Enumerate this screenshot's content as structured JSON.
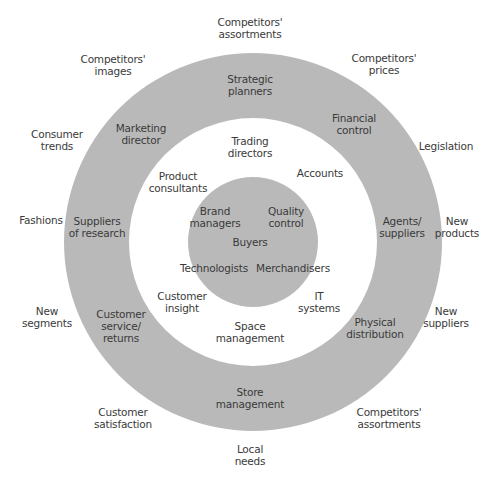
{
  "diagram": {
    "type": "concentric-circles",
    "colors": {
      "ring": "#b9b9b9",
      "background": "#ffffff",
      "text": "#3a3a3a"
    },
    "geometry": {
      "cx": 253,
      "cy": 242,
      "outer_r": 189,
      "hole_r": 124,
      "core_r": 65
    },
    "core_labels": [
      {
        "id": "brand-managers",
        "text": "Brand\nmanagers",
        "x": 215,
        "y": 217
      },
      {
        "id": "quality-control",
        "text": "Quality\ncontrol",
        "x": 286,
        "y": 217
      },
      {
        "id": "buyers",
        "text": "Buyers",
        "x": 250,
        "y": 242
      },
      {
        "id": "technologists",
        "text": "Technologists",
        "x": 214,
        "y": 268
      },
      {
        "id": "merchandisers",
        "text": "Merchandisers",
        "x": 293,
        "y": 268
      }
    ],
    "middle_labels": [
      {
        "id": "trading-directors",
        "text": "Trading\ndirectors",
        "x": 250,
        "y": 147
      },
      {
        "id": "product-consultants",
        "text": "Product\nconsultants",
        "x": 178,
        "y": 182
      },
      {
        "id": "accounts",
        "text": "Accounts",
        "x": 320,
        "y": 173
      },
      {
        "id": "customer-insight",
        "text": "Customer\ninsight",
        "x": 182,
        "y": 302
      },
      {
        "id": "it-systems",
        "text": "IT\nsystems",
        "x": 319,
        "y": 302
      },
      {
        "id": "space-management",
        "text": "Space\nmanagement",
        "x": 250,
        "y": 332
      }
    ],
    "ring_labels": [
      {
        "id": "strategic-planners",
        "text": "Strategic\nplanners",
        "x": 250,
        "y": 85
      },
      {
        "id": "marketing-director",
        "text": "Marketing\ndirector",
        "x": 141,
        "y": 134
      },
      {
        "id": "financial-control",
        "text": "Financial\ncontrol",
        "x": 354,
        "y": 124
      },
      {
        "id": "suppliers-of-research",
        "text": "Suppliers\nof research",
        "x": 97,
        "y": 227
      },
      {
        "id": "agents-suppliers",
        "text": "Agents/\nsuppliers",
        "x": 402,
        "y": 227
      },
      {
        "id": "customer-service-returns",
        "text": "Customer\nservice/\nreturns",
        "x": 121,
        "y": 326
      },
      {
        "id": "physical-distribution",
        "text": "Physical\ndistribution",
        "x": 375,
        "y": 328
      },
      {
        "id": "store-management",
        "text": "Store\nmanagement",
        "x": 250,
        "y": 398
      }
    ],
    "outer_labels": [
      {
        "id": "competitors-assortments-top",
        "text": "Competitors'\nassortments",
        "x": 250,
        "y": 28
      },
      {
        "id": "competitors-images",
        "text": "Competitors'\nimages",
        "x": 113,
        "y": 65
      },
      {
        "id": "competitors-prices",
        "text": "Competitors'\nprices",
        "x": 384,
        "y": 64
      },
      {
        "id": "consumer-trends",
        "text": "Consumer\ntrends",
        "x": 57,
        "y": 140
      },
      {
        "id": "legislation",
        "text": "Legislation",
        "x": 446,
        "y": 146
      },
      {
        "id": "fashions",
        "text": "Fashions",
        "x": 41,
        "y": 220
      },
      {
        "id": "new-products",
        "text": "New\nproducts",
        "x": 457,
        "y": 227
      },
      {
        "id": "new-segments",
        "text": "New\nsegments",
        "x": 47,
        "y": 317
      },
      {
        "id": "new-suppliers",
        "text": "New\nsuppliers",
        "x": 446,
        "y": 317
      },
      {
        "id": "customer-satisfaction",
        "text": "Customer\nsatisfaction",
        "x": 123,
        "y": 418
      },
      {
        "id": "competitors-assortments-bottom",
        "text": "Competitors'\nassortments",
        "x": 389,
        "y": 418
      },
      {
        "id": "local-needs",
        "text": "Local\nneeds",
        "x": 250,
        "y": 455
      }
    ]
  }
}
